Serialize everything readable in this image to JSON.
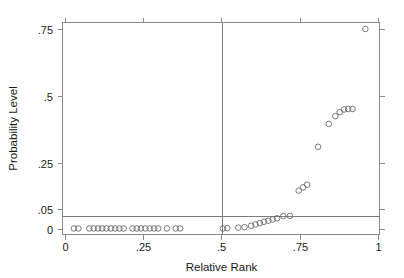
{
  "figure": {
    "background_color": "#ffffff",
    "frame_color": "#8a8a8a",
    "marker_color": "#6b6b6b",
    "reference_line_color": "#7c7c7c"
  },
  "chart_data": {
    "type": "scatter",
    "title": "",
    "xlabel": "Relative Rank",
    "ylabel": "Probability Level",
    "xlim": [
      0,
      1
    ],
    "ylim": [
      0,
      0.78
    ],
    "grid": false,
    "legend": null,
    "xticks": [
      0,
      0.25,
      0.5,
      0.75,
      1
    ],
    "xticklabels": [
      "0",
      ".25",
      ".5",
      ".75",
      "1"
    ],
    "yticks": [
      0,
      0.05,
      0.25,
      0.5,
      0.75
    ],
    "yticklabels": [
      "0",
      ".05",
      ".25",
      ".5",
      ".75"
    ],
    "marker_style": "open-circle",
    "reference_lines": [
      {
        "orientation": "horizontal",
        "value": 0.05,
        "label": ".05 significance level"
      },
      {
        "orientation": "vertical",
        "value": 0.5,
        "label": ".5 relative rank"
      }
    ],
    "x": [
      0.027,
      0.041,
      0.076,
      0.09,
      0.104,
      0.117,
      0.131,
      0.145,
      0.159,
      0.172,
      0.186,
      0.214,
      0.228,
      0.241,
      0.255,
      0.269,
      0.283,
      0.296,
      0.324,
      0.352,
      0.366,
      0.503,
      0.517,
      0.552,
      0.572,
      0.593,
      0.607,
      0.621,
      0.634,
      0.648,
      0.662,
      0.676,
      0.696,
      0.717,
      0.745,
      0.759,
      0.772,
      0.807,
      0.841,
      0.862,
      0.876,
      0.89,
      0.903,
      0.917,
      0.958
    ],
    "y": [
      0.004,
      0.004,
      0.004,
      0.004,
      0.004,
      0.004,
      0.004,
      0.004,
      0.004,
      0.004,
      0.004,
      0.004,
      0.004,
      0.004,
      0.004,
      0.004,
      0.004,
      0.004,
      0.004,
      0.004,
      0.004,
      0.004,
      0.005,
      0.007,
      0.009,
      0.014,
      0.019,
      0.024,
      0.029,
      0.033,
      0.038,
      0.042,
      0.05,
      0.051,
      0.146,
      0.158,
      0.168,
      0.31,
      0.396,
      0.425,
      0.44,
      0.45,
      0.452,
      0.452,
      0.752
    ],
    "n_points": 45
  },
  "axis": {
    "x_title": "Relative Rank",
    "y_title": "Probability Level"
  }
}
